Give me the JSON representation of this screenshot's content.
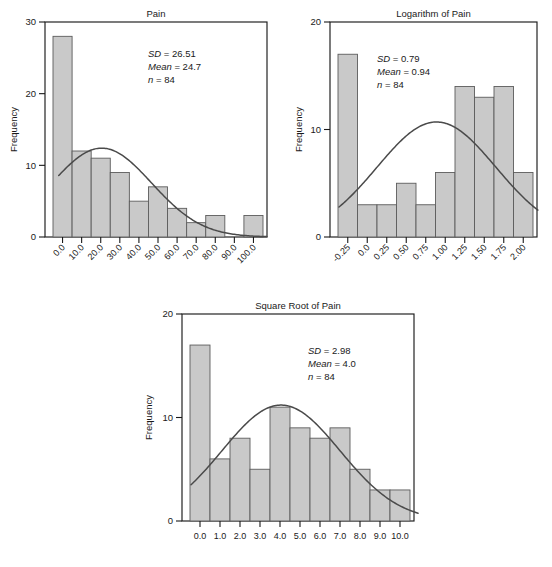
{
  "figure": {
    "ylabel": "Frequency"
  },
  "chart_data": [
    {
      "id": "pain",
      "type": "bar",
      "title": "Pain",
      "xlabel": "",
      "ylabel": "Frequency",
      "ylim": [
        0,
        30
      ],
      "yticks": [
        0,
        10,
        20,
        30
      ],
      "ytick_labels": [
        "0",
        "10",
        "20",
        "30"
      ],
      "grid": false,
      "label_rotation": 45,
      "categories": [
        "0.0",
        "10.0",
        "20.0",
        "30.0",
        "40.0",
        "50.0",
        "60.0",
        "70.0",
        "80.0",
        "90.0",
        "100.0"
      ],
      "values": [
        28,
        12,
        11,
        9,
        5,
        7,
        4,
        2,
        3,
        0,
        3
      ],
      "overlay": {
        "type": "normal-curve",
        "mean": 24.7,
        "sd": 26.51,
        "n": 84
      },
      "annotations": [
        {
          "key": "SD",
          "sep": " = ",
          "value": "26.51"
        },
        {
          "key": "Mean",
          "sep": " = ",
          "value": "24.7"
        },
        {
          "key": "n",
          "sep": " = ",
          "value": "84"
        }
      ]
    },
    {
      "id": "log",
      "type": "bar",
      "title": "Logarithm of Pain",
      "xlabel": "",
      "ylabel": "Frequency",
      "ylim": [
        0,
        20
      ],
      "yticks": [
        0,
        10,
        20
      ],
      "ytick_labels": [
        "0",
        "10",
        "20"
      ],
      "grid": false,
      "label_rotation": 45,
      "categories": [
        "-0.25",
        "0.0",
        "0.25",
        "0.50",
        "0.75",
        "1.00",
        "1.25",
        "1.50",
        "1.75",
        "2.00"
      ],
      "values": [
        17,
        3,
        3,
        5,
        3,
        6,
        14,
        13,
        14,
        6
      ],
      "overlay": {
        "type": "normal-curve",
        "mean": 0.94,
        "sd": 0.79,
        "n": 84
      },
      "annotations": [
        {
          "key": "SD",
          "sep": " = ",
          "value": "0.79"
        },
        {
          "key": "Mean",
          "sep": " = ",
          "value": "0.94"
        },
        {
          "key": "n",
          "sep": " = ",
          "value": "84"
        }
      ]
    },
    {
      "id": "sqrt",
      "type": "bar",
      "title": "Square Root of Pain",
      "xlabel": "",
      "ylabel": "Frequency",
      "ylim": [
        0,
        20
      ],
      "yticks": [
        0,
        10,
        20
      ],
      "ytick_labels": [
        "0",
        "10",
        "20"
      ],
      "grid": false,
      "label_rotation": 0,
      "categories": [
        "0.0",
        "1.0",
        "2.0",
        "3.0",
        "4.0",
        "5.0",
        "6.0",
        "7.0",
        "8.0",
        "9.0",
        "10.0"
      ],
      "values": [
        17,
        6,
        8,
        5,
        11,
        9,
        8,
        9,
        5,
        3,
        3
      ],
      "overlay": {
        "type": "normal-curve",
        "mean": 4.0,
        "sd": 2.98,
        "n": 84
      },
      "annotations": [
        {
          "key": "SD",
          "sep": " = ",
          "value": "2.98"
        },
        {
          "key": "Mean",
          "sep": " = ",
          "value": "4.0"
        },
        {
          "key": "n",
          "sep": " = ",
          "value": "84"
        }
      ]
    }
  ],
  "colors": {
    "bar_fill": "#c9c9c9",
    "bar_stroke": "#5c5c5c",
    "curve": "#4a4a4a",
    "axis": "#1a1a1a"
  }
}
